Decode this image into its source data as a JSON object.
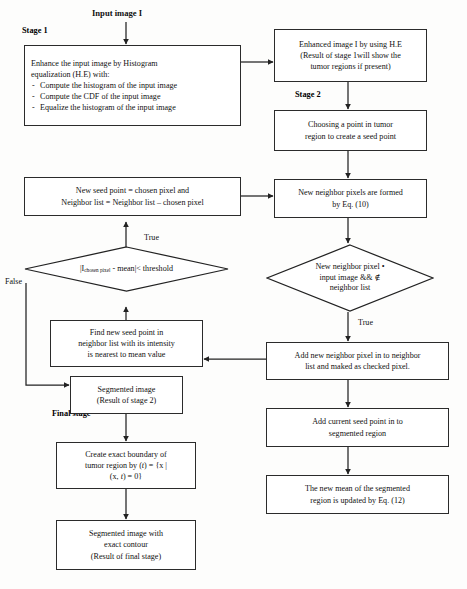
{
  "diagram": {
    "title_input": "Input image I",
    "stage1_label": "Stage 1",
    "stage2_label": "Stage 2",
    "final_stage_label": "Final stage",
    "edge_true_left": "True",
    "edge_false_left": "False",
    "edge_true_right": "True"
  },
  "nodes": {
    "histogram_equalization": {
      "line1": "Enhance the input image by Histogram",
      "line2": "equalization (H.E) with:",
      "bullet1": "Compute the histogram of the input image",
      "bullet2": "Compute the CDF of the input image",
      "bullet3": "Equalize the histogram of the input image"
    },
    "enhanced_image": {
      "line1": "Enhanced image I by using H.E",
      "line2": "(Result of stage 1will show the",
      "line3": "tumor regions if present)"
    },
    "choose_seed_point": {
      "line1": "Choosing a point in tumor",
      "line2": "region to create a seed point"
    },
    "new_neighbor_pixels": {
      "line1": "New neighbor pixels are formed",
      "line2": "by Eq. (10)"
    },
    "new_seed_point": {
      "line1": "New seed point = chosen pixel and",
      "line2": "Neighbor list = Neighbor list – chosen pixel"
    },
    "threshold_decision": {
      "prefix": "|I",
      "subscript": "chosen pixel",
      "suffix": " - mean|< threshold"
    },
    "membership_decision": {
      "line1": "New neighbor pixel •",
      "line2": "input image && ∉",
      "line3": "neighbor list"
    },
    "add_to_neighbor_list": {
      "line1": "Add new neighbor pixel in to neighbor",
      "line2": "list and maked as checked pixel."
    },
    "add_seed_to_region": {
      "line1": "Add current seed point in to",
      "line2": "segmented region"
    },
    "update_mean": {
      "line1": "The new mean of the segmented",
      "line2": "region is updated by Eq. (12)"
    },
    "find_new_seed_point": {
      "line1": "Find new seed point in",
      "line2": "neighbor list with its intensity",
      "line3": "is nearest to mean value"
    },
    "segmented_image_stage2": {
      "line1": "Segmented image",
      "line2": "(Result of stage 2)"
    },
    "create_exact_boundary": {
      "line1": "Create exact boundary   of",
      "line2_a": "tumor region by  (",
      "line2_t": "t",
      "line2_b": ") = {x |",
      "line3_a": "(x, ",
      "line3_t": "t",
      "line3_b": ") = 0}"
    },
    "segmented_with_contour": {
      "line1": "Segmented image with",
      "line2": "exact contour",
      "line3": "(Result of final stage)"
    }
  }
}
